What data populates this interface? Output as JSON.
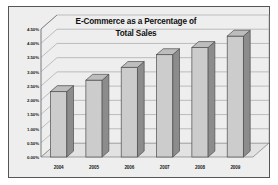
{
  "chart_data": {
    "type": "bar",
    "title_lines": [
      "E-Commerce as a Percentage of",
      "Total Sales"
    ],
    "xlabel": "",
    "ylabel": "",
    "categories": [
      "2004",
      "2005",
      "2006",
      "2007",
      "2008",
      "2009"
    ],
    "values": [
      2.3,
      2.7,
      3.15,
      3.6,
      3.85,
      4.25
    ],
    "ylim": [
      0.0,
      4.5
    ],
    "ytick_step": 0.5,
    "ytick_labels": [
      "0.00%",
      "0.50%",
      "1.00%",
      "1.50%",
      "2.00%",
      "2.50%",
      "3.00%",
      "3.50%",
      "4.00%",
      "4.50%"
    ],
    "ytick_values": [
      0.0,
      0.5,
      1.0,
      1.5,
      2.0,
      2.5,
      3.0,
      3.5,
      4.0,
      4.5
    ],
    "grid": true,
    "legend": false,
    "style": "3d-column"
  },
  "colors": {
    "plot_background": "#eeeeee",
    "frame_border": "#555555",
    "bar_front": "#cccccc",
    "bar_side": "#8c8c8c",
    "bar_top": "#bdbdbd",
    "bar_outline": "#4d4d4d",
    "gridline": "#9a9a9a",
    "axis_line": "#6b6b6b",
    "floor": "#e2e2e2",
    "text": "#1a1a1a"
  }
}
